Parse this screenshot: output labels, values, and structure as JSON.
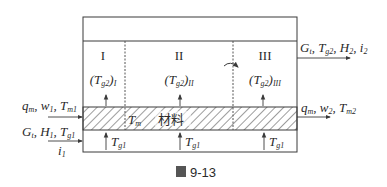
{
  "figure": {
    "caption_icon": "图",
    "caption_number": "9-13",
    "zones": [
      {
        "roman": "I",
        "gas_temp": "T",
        "gas_sub": "g2",
        "zone_sub": "I"
      },
      {
        "roman": "II",
        "gas_temp": "T",
        "gas_sub": "g2",
        "zone_sub": "II"
      },
      {
        "roman": "III",
        "gas_temp": "T",
        "gas_sub": "g2",
        "zone_sub": "III"
      }
    ],
    "material_label": "材料",
    "material_temp": "T",
    "material_temp_sub": "m",
    "inlet_gas_temp": {
      "sym": "T",
      "sub": "g1"
    },
    "inputs": {
      "material_line": "q_m, w_1, T_m1",
      "gas_line": "G_t, H_1, T_g1",
      "enthalpy": "i_1"
    },
    "outputs": {
      "gas_line": "G_t, T_g2, H_2, i_2",
      "material_line": "q_m, w_2, T_m2"
    },
    "colors": {
      "line": "#3a3a3a",
      "text": "#2a2a2a",
      "hatch": "#4a4a4a",
      "background": "#ffffff"
    }
  }
}
